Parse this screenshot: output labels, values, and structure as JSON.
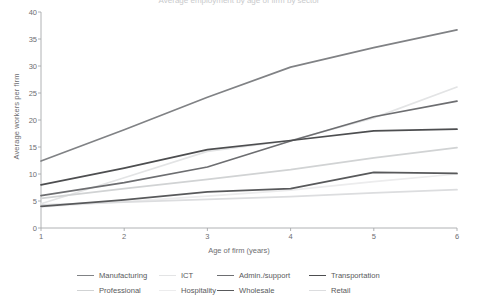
{
  "title_cut": "Average employment by age of firm by sector",
  "axes": {
    "ylabel": "Average workers per firm",
    "xlabel": "Age of firm (years)",
    "yticks": [
      "40",
      "35",
      "30",
      "25",
      "20",
      "15",
      "10",
      "5",
      "0"
    ],
    "xticks": [
      "1",
      "2",
      "3",
      "4",
      "5",
      "6"
    ]
  },
  "legend": {
    "row1": [
      {
        "label": "Manufacturing",
        "color": "#808285"
      },
      {
        "label": "ICT",
        "color": "#e3e4e5"
      },
      {
        "label": "Admin./support",
        "color": "#6d6e71"
      },
      {
        "label": "Transportation",
        "color": "#4d4e50"
      }
    ],
    "row2": [
      {
        "label": "Professional",
        "color": "#d1d3d4"
      },
      {
        "label": "Hospitality",
        "color": "#ececed"
      },
      {
        "label": "Wholesale",
        "color": "#58595b"
      },
      {
        "label": "Retail",
        "color": "#dcdddf"
      }
    ]
  },
  "chart_data": {
    "type": "line",
    "title": "Average employment by age of firm by sector",
    "xlabel": "Age of firm (years)",
    "ylabel": "Average workers per firm",
    "x": [
      1,
      2,
      3,
      4,
      5,
      6
    ],
    "xlim": [
      1,
      6
    ],
    "ylim": [
      0,
      40
    ],
    "ytick_step": 5,
    "grid": false,
    "legend_position": "bottom",
    "series": [
      {
        "name": "Manufacturing",
        "color": "#808285",
        "width": 1.7,
        "values": [
          12.4,
          18.2,
          24.2,
          29.8,
          33.4,
          36.7
        ]
      },
      {
        "name": "ICT",
        "color": "#e3e4e5",
        "width": 1.7,
        "values": [
          4.5,
          9.3,
          14.2,
          16.2,
          20.4,
          26.1
        ]
      },
      {
        "name": "Admin./support",
        "color": "#6d6e71",
        "width": 1.7,
        "values": [
          6.0,
          8.4,
          11.3,
          16.1,
          20.6,
          23.5
        ]
      },
      {
        "name": "Transportation",
        "color": "#4d4e50",
        "width": 1.7,
        "values": [
          8.0,
          11.1,
          14.5,
          16.2,
          18.0,
          18.3
        ]
      },
      {
        "name": "Professional",
        "color": "#d1d3d4",
        "width": 1.7,
        "values": [
          5.5,
          7.3,
          9.0,
          10.8,
          13.0,
          14.9
        ]
      },
      {
        "name": "Hospitality",
        "color": "#ececed",
        "width": 1.7,
        "values": [
          3.9,
          4.9,
          5.9,
          7.0,
          8.6,
          10.0
        ]
      },
      {
        "name": "Wholesale",
        "color": "#58595b",
        "width": 1.7,
        "values": [
          4.0,
          5.2,
          6.7,
          7.3,
          10.3,
          10.1
        ]
      },
      {
        "name": "Retail",
        "color": "#dcdddf",
        "width": 1.7,
        "values": [
          4.3,
          4.8,
          5.3,
          5.8,
          6.5,
          7.1
        ]
      }
    ]
  }
}
